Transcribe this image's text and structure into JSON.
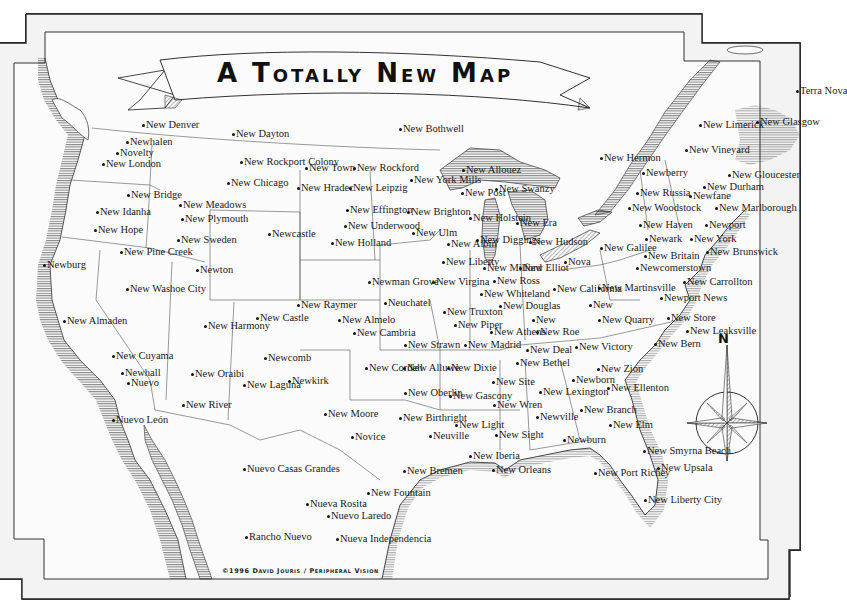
{
  "map": {
    "title": "A Totally New Map",
    "credit": "©1996 David Jouris / Peripheral Vision",
    "compass_label": "N",
    "colors": {
      "paper": "#f8f8f8",
      "ink": "#1a1a1a",
      "frame": "#333333"
    }
  },
  "places": [
    {
      "name": "New Denver",
      "x": 143,
      "y": 125
    },
    {
      "name": "New Dayton",
      "x": 233,
      "y": 134
    },
    {
      "name": "New Bothwell",
      "x": 400,
      "y": 129
    },
    {
      "name": "Newhalen",
      "x": 127,
      "y": 142
    },
    {
      "name": "Novelty",
      "x": 117,
      "y": 153
    },
    {
      "name": "New London",
      "x": 103,
      "y": 164
    },
    {
      "name": "New Rockport Colony",
      "x": 241,
      "y": 162
    },
    {
      "name": "New Town",
      "x": 306,
      "y": 168
    },
    {
      "name": "New Rockford",
      "x": 354,
      "y": 168
    },
    {
      "name": "New York Mills",
      "x": 411,
      "y": 180
    },
    {
      "name": "New Allouez",
      "x": 463,
      "y": 170
    },
    {
      "name": "New Hermon",
      "x": 601,
      "y": 158
    },
    {
      "name": "New Limerick",
      "x": 700,
      "y": 125
    },
    {
      "name": "New Glasgow",
      "x": 757,
      "y": 122
    },
    {
      "name": "Terra Nova",
      "x": 797,
      "y": 91
    },
    {
      "name": "New Vineyard",
      "x": 686,
      "y": 150
    },
    {
      "name": "New Chicago",
      "x": 228,
      "y": 183
    },
    {
      "name": "New Hradec",
      "x": 298,
      "y": 188
    },
    {
      "name": "New Leipzig",
      "x": 350,
      "y": 188
    },
    {
      "name": "New Post",
      "x": 462,
      "y": 193
    },
    {
      "name": "New Swanzy",
      "x": 496,
      "y": 189
    },
    {
      "name": "Newberry",
      "x": 643,
      "y": 173
    },
    {
      "name": "New Gloucester",
      "x": 729,
      "y": 175
    },
    {
      "name": "New Russia",
      "x": 637,
      "y": 193
    },
    {
      "name": "New Durham",
      "x": 704,
      "y": 187
    },
    {
      "name": "Newfane",
      "x": 690,
      "y": 196
    },
    {
      "name": "New Bridge",
      "x": 128,
      "y": 195
    },
    {
      "name": "New Meadows",
      "x": 180,
      "y": 205
    },
    {
      "name": "New Idanha",
      "x": 97,
      "y": 212
    },
    {
      "name": "New Plymouth",
      "x": 182,
      "y": 219
    },
    {
      "name": "New Effington",
      "x": 347,
      "y": 210
    },
    {
      "name": "New Brighton",
      "x": 408,
      "y": 212
    },
    {
      "name": "New Holstein",
      "x": 470,
      "y": 218
    },
    {
      "name": "New Era",
      "x": 517,
      "y": 223
    },
    {
      "name": "New Woodstock",
      "x": 629,
      "y": 208
    },
    {
      "name": "New Marlborough",
      "x": 716,
      "y": 208
    },
    {
      "name": "New Hope",
      "x": 95,
      "y": 230
    },
    {
      "name": "New Underwood",
      "x": 345,
      "y": 226
    },
    {
      "name": "Newcastle",
      "x": 269,
      "y": 234
    },
    {
      "name": "New Ulm",
      "x": 413,
      "y": 233
    },
    {
      "name": "New Diggings",
      "x": 477,
      "y": 240
    },
    {
      "name": "New Hudson",
      "x": 530,
      "y": 242
    },
    {
      "name": "New Haven",
      "x": 640,
      "y": 225
    },
    {
      "name": "Newport",
      "x": 706,
      "y": 225
    },
    {
      "name": "New Sweden",
      "x": 178,
      "y": 240
    },
    {
      "name": "New Holland",
      "x": 332,
      "y": 243
    },
    {
      "name": "New Albin",
      "x": 448,
      "y": 244
    },
    {
      "name": "New Galilee",
      "x": 601,
      "y": 248
    },
    {
      "name": "Newark",
      "x": 646,
      "y": 239
    },
    {
      "name": "New York",
      "x": 691,
      "y": 239
    },
    {
      "name": "New Britain",
      "x": 645,
      "y": 256
    },
    {
      "name": "New Brunswick",
      "x": 707,
      "y": 252
    },
    {
      "name": "New Pine Creek",
      "x": 121,
      "y": 252
    },
    {
      "name": "Newburg",
      "x": 44,
      "y": 265
    },
    {
      "name": "New Liberty",
      "x": 443,
      "y": 262
    },
    {
      "name": "New Milford",
      "x": 484,
      "y": 268
    },
    {
      "name": "New Elliot",
      "x": 520,
      "y": 268
    },
    {
      "name": "Nova",
      "x": 565,
      "y": 262
    },
    {
      "name": "Newcomerstown",
      "x": 637,
      "y": 268
    },
    {
      "name": "Newton",
      "x": 197,
      "y": 270
    },
    {
      "name": "New Washoe City",
      "x": 127,
      "y": 289
    },
    {
      "name": "Newman Grove",
      "x": 369,
      "y": 282
    },
    {
      "name": "New Virgina",
      "x": 433,
      "y": 282
    },
    {
      "name": "New Ross",
      "x": 494,
      "y": 281
    },
    {
      "name": "New California",
      "x": 554,
      "y": 289
    },
    {
      "name": "New Martinsville",
      "x": 599,
      "y": 288
    },
    {
      "name": "New Carrollton",
      "x": 684,
      "y": 282
    },
    {
      "name": "New Whiteland",
      "x": 481,
      "y": 294
    },
    {
      "name": "New Raymer",
      "x": 298,
      "y": 305
    },
    {
      "name": "Neuchatel",
      "x": 385,
      "y": 303
    },
    {
      "name": "New Truxton",
      "x": 444,
      "y": 312
    },
    {
      "name": "New Douglas",
      "x": 500,
      "y": 306
    },
    {
      "name": "Newport News",
      "x": 661,
      "y": 298
    },
    {
      "name": "New Almelo",
      "x": 339,
      "y": 320
    },
    {
      "name": "New Castle",
      "x": 257,
      "y": 318
    },
    {
      "name": "New Cambria",
      "x": 354,
      "y": 333
    },
    {
      "name": "New Piper",
      "x": 455,
      "y": 325
    },
    {
      "name": "New Athens",
      "x": 491,
      "y": 332
    },
    {
      "name": "New",
      "x": 533,
      "y": 320
    },
    {
      "name": "New Quarry",
      "x": 599,
      "y": 320
    },
    {
      "name": "New Store",
      "x": 668,
      "y": 318
    },
    {
      "name": "New Leaksville",
      "x": 687,
      "y": 331
    },
    {
      "name": "New",
      "x": 590,
      "y": 305
    },
    {
      "name": "New Almaden",
      "x": 64,
      "y": 321
    },
    {
      "name": "New Harmony",
      "x": 205,
      "y": 326
    },
    {
      "name": "New Strawn",
      "x": 405,
      "y": 345
    },
    {
      "name": "New Madrid",
      "x": 465,
      "y": 345
    },
    {
      "name": "New Roe",
      "x": 537,
      "y": 332
    },
    {
      "name": "New Bern",
      "x": 655,
      "y": 344
    },
    {
      "name": "New Deal",
      "x": 527,
      "y": 350
    },
    {
      "name": "New Victory",
      "x": 576,
      "y": 347
    },
    {
      "name": "New Cuyama",
      "x": 113,
      "y": 356
    },
    {
      "name": "Newcomb",
      "x": 265,
      "y": 358
    },
    {
      "name": "New Cordell",
      "x": 366,
      "y": 368
    },
    {
      "name": "New Alluwe",
      "x": 404,
      "y": 368
    },
    {
      "name": "New Dixie",
      "x": 448,
      "y": 368
    },
    {
      "name": "New Bethel",
      "x": 517,
      "y": 363
    },
    {
      "name": "New Zion",
      "x": 598,
      "y": 369
    },
    {
      "name": "Newhall",
      "x": 122,
      "y": 373
    },
    {
      "name": "Nuevo",
      "x": 128,
      "y": 383
    },
    {
      "name": "New Oraibi",
      "x": 192,
      "y": 374
    },
    {
      "name": "New Laguna",
      "x": 244,
      "y": 385
    },
    {
      "name": "Newkirk",
      "x": 289,
      "y": 381
    },
    {
      "name": "New Oberlin",
      "x": 405,
      "y": 393
    },
    {
      "name": "New Gascony",
      "x": 450,
      "y": 396
    },
    {
      "name": "New Site",
      "x": 493,
      "y": 382
    },
    {
      "name": "New Lexington",
      "x": 540,
      "y": 392
    },
    {
      "name": "Newborn",
      "x": 573,
      "y": 380
    },
    {
      "name": "New Ellenton",
      "x": 608,
      "y": 388
    },
    {
      "name": "New River",
      "x": 183,
      "y": 405
    },
    {
      "name": "New Moore",
      "x": 325,
      "y": 414
    },
    {
      "name": "New Birthright",
      "x": 400,
      "y": 418
    },
    {
      "name": "New Wren",
      "x": 494,
      "y": 405
    },
    {
      "name": "Newville",
      "x": 537,
      "y": 417
    },
    {
      "name": "New Branch",
      "x": 581,
      "y": 410
    },
    {
      "name": "Nuevo León",
      "x": 113,
      "y": 420
    },
    {
      "name": "Novice",
      "x": 352,
      "y": 437
    },
    {
      "name": "Neuville",
      "x": 430,
      "y": 436
    },
    {
      "name": "New Light",
      "x": 456,
      "y": 425
    },
    {
      "name": "New Sight",
      "x": 496,
      "y": 435
    },
    {
      "name": "New Elm",
      "x": 610,
      "y": 425
    },
    {
      "name": "Newburn",
      "x": 564,
      "y": 440
    },
    {
      "name": "New Smyrna Beach",
      "x": 644,
      "y": 451
    },
    {
      "name": "Nuevo Casas Grandes",
      "x": 244,
      "y": 469
    },
    {
      "name": "New Iberia",
      "x": 470,
      "y": 456
    },
    {
      "name": "New Orleans",
      "x": 493,
      "y": 470
    },
    {
      "name": "New Bremen",
      "x": 404,
      "y": 471
    },
    {
      "name": "New Upsala",
      "x": 658,
      "y": 468
    },
    {
      "name": "New Port Richey",
      "x": 595,
      "y": 473
    },
    {
      "name": "New Fountain",
      "x": 368,
      "y": 493
    },
    {
      "name": "New Liberty City",
      "x": 645,
      "y": 500
    },
    {
      "name": "Nueva Rosita",
      "x": 307,
      "y": 504
    },
    {
      "name": "Nuevo Laredo",
      "x": 328,
      "y": 516
    },
    {
      "name": "Rancho Nuevo",
      "x": 246,
      "y": 537
    },
    {
      "name": "Nueva Independencia",
      "x": 337,
      "y": 539
    }
  ]
}
